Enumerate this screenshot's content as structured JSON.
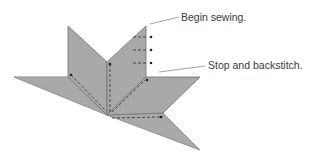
{
  "diagram": {
    "labels": {
      "begin": "Begin sewing.",
      "stop": "Stop and backstitch."
    },
    "colors": {
      "fabric": "#a9a9a9",
      "outline": "#6f6f6f",
      "stitch": "#3a3a3a",
      "leader": "#8a8a8a"
    }
  }
}
